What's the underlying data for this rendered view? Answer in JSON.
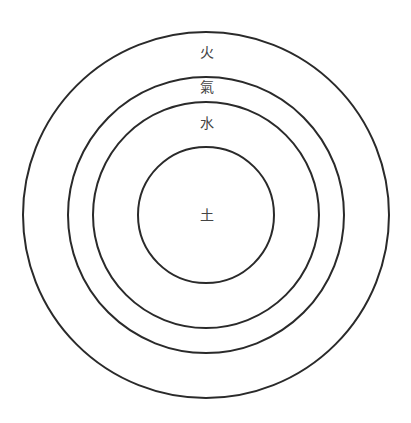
{
  "diagram": {
    "type": "concentric-circles",
    "center": [
      206,
      215
    ],
    "stroke_color": "#2a2a2a",
    "rings": [
      {
        "name": "fire",
        "label": "火",
        "radius": 183,
        "label_y": 52
      },
      {
        "name": "air",
        "label": "氣",
        "radius": 138,
        "label_y": 87
      },
      {
        "name": "water",
        "label": "水",
        "radius": 113,
        "label_y": 123
      },
      {
        "name": "earth",
        "label": "土",
        "radius": 68,
        "label_y": 215
      }
    ]
  }
}
